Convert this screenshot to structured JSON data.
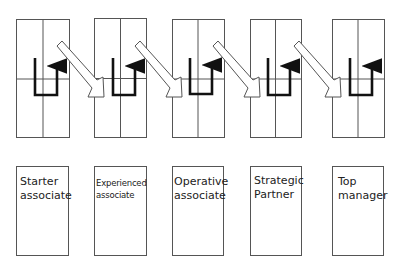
{
  "diagram": {
    "type": "career-progression",
    "colors": {
      "line": "#555555",
      "arrow": "#111111",
      "text": "#222222",
      "background": "#ffffff"
    },
    "stages": [
      {
        "label": "Starter associate",
        "lines": [
          "Starter",
          "associate"
        ],
        "small": false
      },
      {
        "label": "Experienced associate",
        "lines": [
          "Experienced",
          "associate"
        ],
        "small": true
      },
      {
        "label": "Operative associate",
        "lines": [
          "Operative",
          "associate"
        ],
        "small": false
      },
      {
        "label": "Strategic Partner",
        "lines": [
          "Strategic",
          "Partner"
        ],
        "small": false
      },
      {
        "label": "Top manager",
        "lines": [
          "Top",
          "manager"
        ],
        "small": false
      }
    ],
    "grid_boxes": 5,
    "transition_arrows": 4
  }
}
